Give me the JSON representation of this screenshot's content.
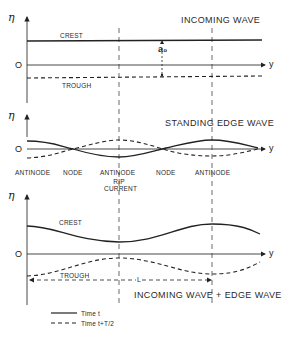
{
  "panels": [
    {
      "id": "incoming-wave",
      "title": "INCOMING WAVE",
      "axis_y_label": "η",
      "axis_x_label": "y",
      "origin_label": "O",
      "labels": {
        "crest": "CREST",
        "trough": "TROUGH",
        "amplitude": "a₀"
      }
    },
    {
      "id": "standing-edge-wave",
      "title": "STANDING EDGE WAVE",
      "axis_y_label": "η",
      "axis_x_label": "y",
      "origin_label": "O",
      "position_labels": [
        "ANTINODE",
        "NODE",
        "ANTINODE",
        "NODE",
        "ANTINODE"
      ],
      "rip_current_label": "RIP CURRENT"
    },
    {
      "id": "combined-wave",
      "title": "INCOMING WAVE + EDGE WAVE",
      "axis_y_label": "η",
      "axis_x_label": "y",
      "origin_label": "O",
      "labels": {
        "crest": "CREST",
        "trough": "TROUGH",
        "length": "L"
      }
    }
  ],
  "legend": {
    "solid": "Time t",
    "dashed": "Time t+T/2"
  }
}
